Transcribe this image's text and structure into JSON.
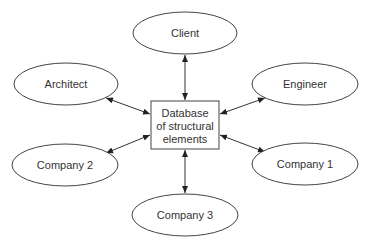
{
  "diagram": {
    "center": {
      "lines": [
        "Database",
        "of structural",
        "elements"
      ]
    },
    "nodes": [
      {
        "id": "client",
        "label": "Client"
      },
      {
        "id": "architect",
        "label": "Architect"
      },
      {
        "id": "engineer",
        "label": "Engineer"
      },
      {
        "id": "company2",
        "label": "Company 2"
      },
      {
        "id": "company1",
        "label": "Company 1"
      },
      {
        "id": "company3",
        "label": "Company 3"
      }
    ],
    "edges": [
      {
        "from": "client",
        "to": "center",
        "bidirectional": true
      },
      {
        "from": "architect",
        "to": "center",
        "bidirectional": true
      },
      {
        "from": "engineer",
        "to": "center",
        "bidirectional": true
      },
      {
        "from": "company2",
        "to": "center",
        "bidirectional": true
      },
      {
        "from": "company1",
        "to": "center",
        "bidirectional": true
      },
      {
        "from": "company3",
        "to": "center",
        "bidirectional": true
      }
    ],
    "colors": {
      "stroke": "#333333",
      "text": "#333333",
      "background": "#ffffff"
    }
  }
}
